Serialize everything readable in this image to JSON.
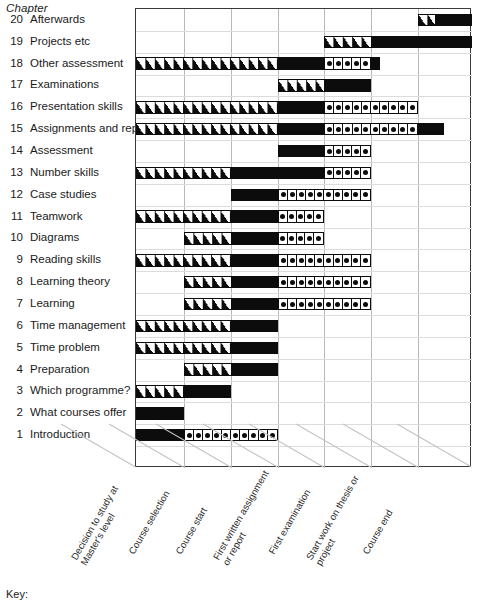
{
  "header": {
    "chapter_heading": "Chapter"
  },
  "key": {
    "label": "Key:"
  },
  "chart_data": {
    "type": "bar",
    "title": "",
    "xlabel": "",
    "ylabel": "Chapter",
    "grid": true,
    "legend_position": "bottom-left",
    "axis_categories": [
      "Decision to study at\nMaster's level",
      "Course selection",
      "Course start",
      "First written assignment\nor report",
      "First examination",
      "Start work on thesis or\nproject",
      "Course end"
    ],
    "axis_positions": [
      135,
      183,
      230,
      277,
      323,
      370,
      417
    ],
    "x_range": [
      135,
      471
    ],
    "segment_styles": [
      "hatch",
      "solid",
      "dotted"
    ],
    "categories": [
      "20 Afterwards",
      "19 Projects etc",
      "18 Other assessment",
      "17 Examinations",
      "16 Presentation skills",
      "15 Assignments and reports",
      "14 Assessment",
      "13 Number skills",
      "12 Case studies",
      "11 Teamwork",
      "10 Diagrams",
      "9 Reading skills",
      "8 Learning theory",
      "7 Learning",
      "6 Time management",
      "5 Time problem",
      "4 Preparation",
      "3 Which programme?",
      "2 What courses offer",
      "1 Introduction"
    ],
    "rows": [
      {
        "num": "20",
        "label": "Afterwards",
        "segments": [
          {
            "style": "hatch",
            "start": 417,
            "end": 434
          },
          {
            "style": "solid",
            "start": 434,
            "end": 471
          }
        ]
      },
      {
        "num": "19",
        "label": "Projects etc",
        "segments": [
          {
            "style": "hatch",
            "start": 323,
            "end": 370
          },
          {
            "style": "solid",
            "start": 370,
            "end": 471
          }
        ]
      },
      {
        "num": "18",
        "label": "Other assessment",
        "segments": [
          {
            "style": "hatch",
            "start": 135,
            "end": 277
          },
          {
            "style": "solid",
            "start": 277,
            "end": 323
          },
          {
            "style": "dotted",
            "start": 323,
            "end": 370,
            "cells": 5
          },
          {
            "style": "solid",
            "start": 370,
            "end": 379
          }
        ]
      },
      {
        "num": "17",
        "label": "Examinations",
        "segments": [
          {
            "style": "hatch",
            "start": 277,
            "end": 323
          },
          {
            "style": "solid",
            "start": 323,
            "end": 370
          }
        ]
      },
      {
        "num": "16",
        "label": "Presentation skills",
        "segments": [
          {
            "style": "hatch",
            "start": 135,
            "end": 277
          },
          {
            "style": "solid",
            "start": 277,
            "end": 323
          },
          {
            "style": "dotted",
            "start": 323,
            "end": 417,
            "cells": 10
          }
        ]
      },
      {
        "num": "15",
        "label": "Assignments and reports",
        "segments": [
          {
            "style": "hatch",
            "start": 135,
            "end": 277
          },
          {
            "style": "solid",
            "start": 277,
            "end": 323
          },
          {
            "style": "dotted",
            "start": 323,
            "end": 417,
            "cells": 10
          },
          {
            "style": "solid",
            "start": 417,
            "end": 443
          }
        ]
      },
      {
        "num": "14",
        "label": "Assessment",
        "segments": [
          {
            "style": "solid",
            "start": 277,
            "end": 323
          },
          {
            "style": "dotted",
            "start": 323,
            "end": 370,
            "cells": 5
          }
        ]
      },
      {
        "num": "13",
        "label": "Number skills",
        "segments": [
          {
            "style": "hatch",
            "start": 135,
            "end": 230
          },
          {
            "style": "solid",
            "start": 230,
            "end": 323
          },
          {
            "style": "dotted",
            "start": 323,
            "end": 370,
            "cells": 5
          }
        ]
      },
      {
        "num": "12",
        "label": "Case studies",
        "segments": [
          {
            "style": "solid",
            "start": 230,
            "end": 277
          },
          {
            "style": "dotted",
            "start": 277,
            "end": 370,
            "cells": 10
          }
        ]
      },
      {
        "num": "11",
        "label": "Teamwork",
        "segments": [
          {
            "style": "hatch",
            "start": 135,
            "end": 230
          },
          {
            "style": "solid",
            "start": 230,
            "end": 277
          },
          {
            "style": "dotted",
            "start": 277,
            "end": 323,
            "cells": 5
          }
        ]
      },
      {
        "num": "10",
        "label": "Diagrams",
        "segments": [
          {
            "style": "hatch",
            "start": 183,
            "end": 230
          },
          {
            "style": "solid",
            "start": 230,
            "end": 277
          },
          {
            "style": "dotted",
            "start": 277,
            "end": 323,
            "cells": 5
          }
        ]
      },
      {
        "num": "9",
        "label": "Reading skills",
        "segments": [
          {
            "style": "hatch",
            "start": 135,
            "end": 230
          },
          {
            "style": "solid",
            "start": 230,
            "end": 277
          },
          {
            "style": "dotted",
            "start": 277,
            "end": 370,
            "cells": 10
          }
        ]
      },
      {
        "num": "8",
        "label": "Learning theory",
        "segments": [
          {
            "style": "hatch",
            "start": 183,
            "end": 230
          },
          {
            "style": "solid",
            "start": 230,
            "end": 277
          },
          {
            "style": "dotted",
            "start": 277,
            "end": 370,
            "cells": 10
          }
        ]
      },
      {
        "num": "7",
        "label": "Learning",
        "segments": [
          {
            "style": "hatch",
            "start": 183,
            "end": 230
          },
          {
            "style": "solid",
            "start": 230,
            "end": 277
          },
          {
            "style": "dotted",
            "start": 277,
            "end": 370,
            "cells": 10
          }
        ]
      },
      {
        "num": "6",
        "label": "Time management",
        "segments": [
          {
            "style": "hatch",
            "start": 135,
            "end": 230
          },
          {
            "style": "solid",
            "start": 230,
            "end": 277
          }
        ]
      },
      {
        "num": "5",
        "label": "Time problem",
        "segments": [
          {
            "style": "hatch",
            "start": 135,
            "end": 230
          },
          {
            "style": "solid",
            "start": 230,
            "end": 277
          }
        ]
      },
      {
        "num": "4",
        "label": "Preparation",
        "segments": [
          {
            "style": "hatch",
            "start": 183,
            "end": 230
          },
          {
            "style": "solid",
            "start": 230,
            "end": 277
          }
        ]
      },
      {
        "num": "3",
        "label": "Which programme?",
        "segments": [
          {
            "style": "hatch",
            "start": 135,
            "end": 183
          },
          {
            "style": "solid",
            "start": 183,
            "end": 230
          }
        ]
      },
      {
        "num": "2",
        "label": "What courses offer",
        "segments": [
          {
            "style": "solid",
            "start": 135,
            "end": 183
          }
        ]
      },
      {
        "num": "1",
        "label": "Introduction",
        "segments": [
          {
            "style": "solid",
            "start": 135,
            "end": 183
          },
          {
            "style": "dotted",
            "start": 183,
            "end": 277,
            "cells": 10
          }
        ]
      }
    ]
  }
}
